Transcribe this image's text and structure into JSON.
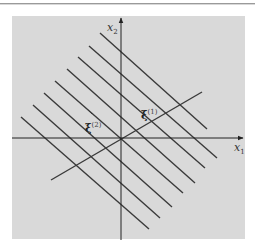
{
  "diagram": {
    "axes": {
      "x1_label": "x",
      "x1_sub": "1",
      "x2_label": "x",
      "x2_sub": "2"
    },
    "vectors": [
      {
        "symbol": "ξ",
        "superscript": "(1)"
      },
      {
        "symbol": "ξ",
        "superscript": "(2)"
      }
    ],
    "parallel_line_count": 8,
    "colors": {
      "background_panel": "#d9d9d9",
      "lines": "#3a3a3a",
      "page": "#ffffff"
    }
  }
}
